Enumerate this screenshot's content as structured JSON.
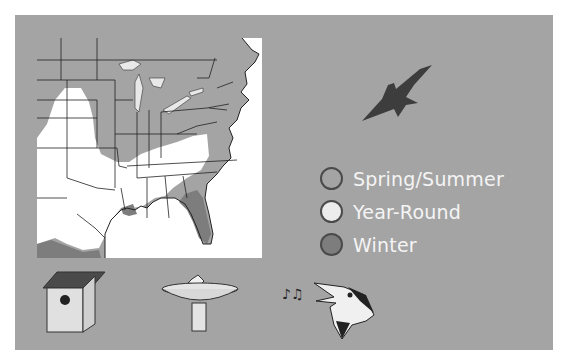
{
  "legend": {
    "items": [
      {
        "label": "Spring/Summer",
        "color": "#a4a4a4"
      },
      {
        "label": "Year-Round",
        "color": "#e8e8e8"
      },
      {
        "label": "Winter",
        "color": "#7d7d7d"
      }
    ]
  },
  "colors": {
    "panel_bg": "#a4a4a4",
    "map_water": "#ffffff",
    "spring_summer": "#a4a4a4",
    "year_round": "#ffffff",
    "winter": "#7d7d7d",
    "bird_silhouette": "#3d3d3d"
  },
  "icons": {
    "range_bird": "bird-silhouette-icon",
    "nest": "birdhouse-icon",
    "water": "birdbath-icon",
    "song": "singing-bird-icon"
  }
}
